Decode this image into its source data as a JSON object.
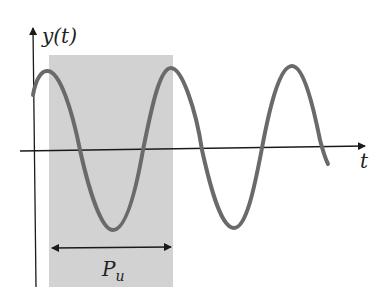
{
  "diagram": {
    "y_axis_label": "y(t)",
    "x_axis_label": "t",
    "period_label_main": "P",
    "period_label_sub": "u",
    "colors": {
      "shade": "#d2d2d2",
      "curve": "#6a6a6a",
      "axis": "#1a1a1a"
    }
  }
}
